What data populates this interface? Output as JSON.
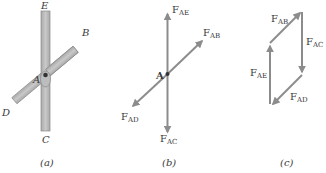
{
  "figure": {
    "panels": [
      {
        "id": "a",
        "caption": "(a)",
        "description": "Two crossing bars pinned at A",
        "points": {
          "E": "E",
          "B": "B",
          "A": "A",
          "D": "D",
          "C": "C"
        }
      },
      {
        "id": "b",
        "caption": "(b)",
        "description": "Free-body diagram of pin A",
        "point_label": "A",
        "forces": [
          {
            "name": "F",
            "sub": "AE",
            "direction": "up"
          },
          {
            "name": "F",
            "sub": "AB",
            "direction": "up-right"
          },
          {
            "name": "F",
            "sub": "AD",
            "direction": "down-left"
          },
          {
            "name": "F",
            "sub": "AC",
            "direction": "down"
          }
        ]
      },
      {
        "id": "c",
        "caption": "(c)",
        "description": "Closed force polygon",
        "forces": [
          {
            "name": "F",
            "sub": "AB"
          },
          {
            "name": "F",
            "sub": "AC"
          },
          {
            "name": "F",
            "sub": "AD"
          },
          {
            "name": "F",
            "sub": "AE"
          }
        ]
      }
    ],
    "colors": {
      "bar_fill": "#b8b8b8",
      "bar_stroke": "#8a8a8a",
      "arrow": "#8c8c8c",
      "text": "#3a3a3a"
    }
  }
}
